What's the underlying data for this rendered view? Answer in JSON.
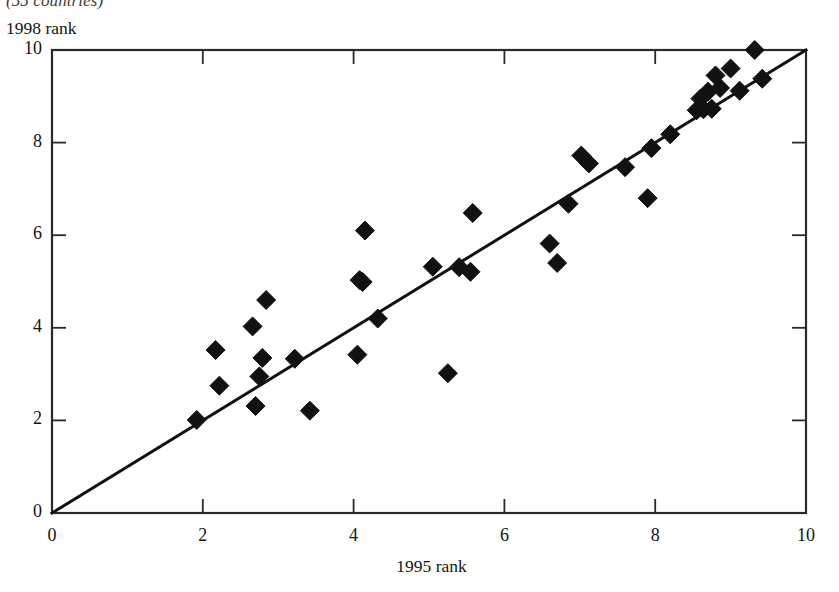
{
  "caption": {
    "text": "(55 countries)"
  },
  "chart_data": {
    "type": "scatter",
    "title": "",
    "subtitle": "(55 countries)",
    "xlabel": "1995 rank",
    "ylabel": "1998 rank",
    "xlim": [
      0,
      10
    ],
    "ylim": [
      0,
      10
    ],
    "xticks": [
      "0",
      "2",
      "4",
      "6",
      "8",
      "10"
    ],
    "yticks": [
      "0",
      "2",
      "4",
      "6",
      "8",
      "10"
    ],
    "xtick_values": [
      0,
      2,
      4,
      6,
      8,
      10
    ],
    "ytick_values": [
      0,
      2,
      4,
      6,
      8,
      10
    ],
    "grid": false,
    "legend": null,
    "marker": "diamond",
    "marker_color": "#111111",
    "reference_line": {
      "name": "45-degree line",
      "from": [
        0,
        0
      ],
      "to": [
        10,
        10
      ],
      "color": "#111111"
    },
    "series": [
      {
        "name": "countries",
        "points": [
          [
            1.92,
            2.01
          ],
          [
            2.17,
            3.52
          ],
          [
            2.22,
            2.75
          ],
          [
            2.66,
            4.03
          ],
          [
            2.7,
            2.31
          ],
          [
            2.75,
            2.95
          ],
          [
            2.79,
            3.35
          ],
          [
            2.84,
            4.6
          ],
          [
            3.22,
            3.33
          ],
          [
            3.42,
            2.21
          ],
          [
            4.05,
            3.42
          ],
          [
            4.08,
            5.03
          ],
          [
            4.12,
            4.99
          ],
          [
            4.15,
            6.1
          ],
          [
            4.32,
            4.2
          ],
          [
            5.05,
            5.32
          ],
          [
            5.25,
            3.02
          ],
          [
            5.4,
            5.31
          ],
          [
            5.55,
            5.21
          ],
          [
            5.58,
            6.48
          ],
          [
            6.6,
            5.82
          ],
          [
            6.7,
            5.4
          ],
          [
            6.85,
            6.68
          ],
          [
            7.02,
            7.72
          ],
          [
            7.12,
            7.55
          ],
          [
            7.6,
            7.47
          ],
          [
            7.9,
            6.8
          ],
          [
            7.95,
            7.88
          ],
          [
            8.2,
            8.18
          ],
          [
            8.55,
            8.7
          ],
          [
            8.6,
            8.95
          ],
          [
            8.64,
            8.72
          ],
          [
            8.7,
            9.1
          ],
          [
            8.75,
            8.73
          ],
          [
            8.8,
            9.45
          ],
          [
            8.86,
            9.18
          ],
          [
            9.0,
            9.6
          ],
          [
            9.12,
            9.12
          ],
          [
            9.32,
            10.0
          ],
          [
            9.42,
            9.38
          ]
        ]
      }
    ]
  },
  "axes": {
    "x_title": "1995 rank",
    "y_title": "1998 rank"
  }
}
